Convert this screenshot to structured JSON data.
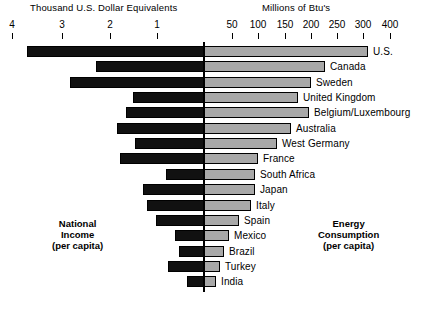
{
  "chart_data": {
    "type": "bar",
    "title": "",
    "orientation": "horizontal-diverging",
    "left_axis": {
      "title": "Thousand U.S. Dollar Equivalents",
      "caption": [
        "National",
        "Income",
        "(per capita)"
      ],
      "unit": "Thousand U.S. Dollar Equivalents",
      "direction": "right-to-left",
      "ticks": [
        {
          "label": "4",
          "value": 4,
          "x": 12
        },
        {
          "label": "3",
          "value": 3,
          "x": 62
        },
        {
          "label": "2",
          "value": 2,
          "x": 110
        },
        {
          "label": "1",
          "value": 1,
          "x": 157
        }
      ],
      "range": [
        0,
        4.3
      ]
    },
    "right_axis": {
      "title": "Millions of Btu's",
      "caption": [
        "Energy",
        "Consumption",
        "(per capita)"
      ],
      "unit": "Millions of Btu's",
      "direction": "left-to-right",
      "ticks": [
        {
          "label": "50",
          "value": 50,
          "x": 232
        },
        {
          "label": "100",
          "value": 100,
          "x": 258
        },
        {
          "label": "150",
          "value": 150,
          "x": 285
        },
        {
          "label": "200",
          "value": 200,
          "x": 311
        },
        {
          "label": "250",
          "value": 250,
          "x": 337
        },
        {
          "label": "300",
          "value": 300,
          "x": 363
        },
        {
          "label": "400",
          "value": 400,
          "x": 390
        }
      ],
      "note": "axis compresses above 300"
    },
    "grid": false,
    "legend": false,
    "categories": [
      "U.S.",
      "Canada",
      "Sweden",
      "United Kingdom",
      "Belgium/Luxembourg",
      "Australia",
      "West Germany",
      "France",
      "South Africa",
      "Japan",
      "Italy",
      "Spain",
      "Mexico",
      "Brazil",
      "Turkey",
      "India"
    ],
    "series": [
      {
        "name": "National Income (per capita)",
        "unit": "Thousand U.S. Dollar Equivalents",
        "color": "#111111",
        "values": [
          3.73,
          2.26,
          3.03,
          1.42,
          1.58,
          1.91,
          1.49,
          1.79,
          0.7,
          1.27,
          1.56,
          0.99,
          0.66,
          0.5,
          0.77,
          0.24
        ]
      },
      {
        "name": "Energy Consumption (per capita)",
        "unit": "Millions of Btu's",
        "color": "#a8a8a8",
        "values": [
          390,
          310,
          205,
          173,
          200,
          168,
          150,
          128,
          105,
          105,
          100,
          73,
          50,
          42,
          32,
          15
        ]
      }
    ],
    "rows": [
      {
        "label": "U.S.",
        "left_px": 27,
        "right_px": 368,
        "income": 3.73,
        "energy": 390
      },
      {
        "label": "Canada",
        "left_px": 96,
        "right_px": 325,
        "income": 2.26,
        "energy": 310
      },
      {
        "label": "Sweden",
        "left_px": 70,
        "right_px": 311,
        "income": 3.03,
        "energy": 205
      },
      {
        "label": "United Kingdom",
        "left_px": 133,
        "right_px": 298,
        "income": 1.42,
        "energy": 173
      },
      {
        "label": "Belgium/Luxembourg",
        "left_px": 126,
        "right_px": 309,
        "income": 1.58,
        "energy": 200
      },
      {
        "label": "Australia",
        "left_px": 117,
        "right_px": 291,
        "income": 1.91,
        "energy": 168
      },
      {
        "label": "West Germany",
        "left_px": 135,
        "right_px": 277,
        "income": 1.49,
        "energy": 150
      },
      {
        "label": "France",
        "left_px": 120,
        "right_px": 258,
        "income": 1.79,
        "energy": 128
      },
      {
        "label": "South Africa",
        "left_px": 166,
        "right_px": 255,
        "income": 0.7,
        "energy": 105
      },
      {
        "label": "Japan",
        "left_px": 143,
        "right_px": 255,
        "income": 1.27,
        "energy": 105
      },
      {
        "label": "Italy",
        "left_px": 147,
        "right_px": 251,
        "income": 1.56,
        "energy": 100
      },
      {
        "label": "Spain",
        "left_px": 156,
        "right_px": 239,
        "income": 0.99,
        "energy": 73
      },
      {
        "label": "Mexico",
        "left_px": 175,
        "right_px": 229,
        "income": 0.66,
        "energy": 50
      },
      {
        "label": "Brazil",
        "left_px": 179,
        "right_px": 224,
        "income": 0.5,
        "energy": 42
      },
      {
        "label": "Turkey",
        "left_px": 168,
        "right_px": 220,
        "income": 0.77,
        "energy": 32
      },
      {
        "label": "India",
        "left_px": 187,
        "right_px": 216,
        "income": 0.24,
        "energy": 15
      }
    ],
    "colors": {
      "income_bar": "#111111",
      "energy_bar": "#a8a8a8",
      "axis": "#000000",
      "background": "#ffffff"
    }
  }
}
